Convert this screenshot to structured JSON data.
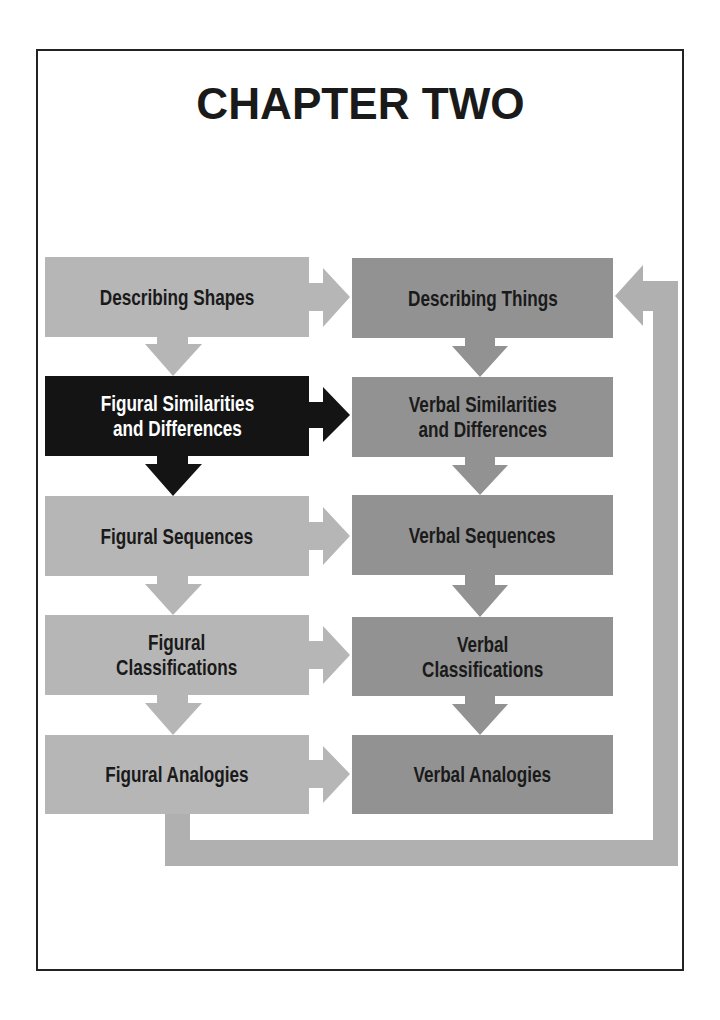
{
  "title": "CHAPTER TWO",
  "colors": {
    "figural_column": "#b6b6b6",
    "verbal_column": "#929292",
    "highlight": "#141414",
    "text": "#1a1a1a",
    "highlight_text": "#ffffff",
    "frame": "#222222"
  },
  "figural": [
    {
      "label": "Describing Shapes",
      "highlighted": false
    },
    {
      "label": "Figural Similarities\nand Differences",
      "highlighted": true
    },
    {
      "label": "Figural Sequences",
      "highlighted": false
    },
    {
      "label": "Figural\nClassifications",
      "highlighted": false
    },
    {
      "label": "Figural Analogies",
      "highlighted": false
    }
  ],
  "verbal": [
    {
      "label": "Describing Things"
    },
    {
      "label": "Verbal Similarities\nand Differences"
    },
    {
      "label": "Verbal Sequences"
    },
    {
      "label": "Verbal\nClassifications"
    },
    {
      "label": "Verbal Analogies"
    }
  ]
}
